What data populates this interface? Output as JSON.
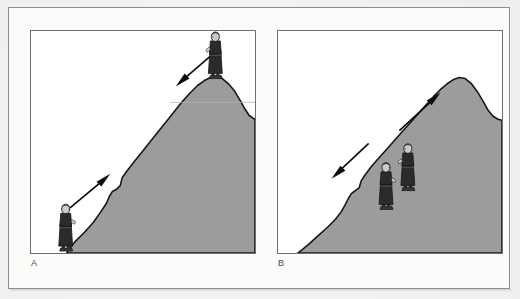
{
  "figure": {
    "panels": [
      {
        "id": "A",
        "label": "A",
        "caption_letter": "A",
        "description": "Single rounded hill with a person standing at the summit and a person standing at the base; one arrow points up the slope and one arrow points down the slope.",
        "terrain_fill": "#9c9c9c",
        "terrain_outline": "#1a1a1a",
        "background": "#ffffff",
        "figures": [
          {
            "name": "climber-at-summit",
            "position": "summit",
            "facing": "right",
            "coat_color": "#2b2b2b",
            "hair_color": "#c9c9c9"
          },
          {
            "name": "climber-at-base",
            "position": "base",
            "facing": "right",
            "coat_color": "#2b2b2b",
            "hair_color": "#c9c9c9"
          }
        ],
        "arrows": [
          {
            "name": "arrow-descend",
            "direction": "down-left",
            "color": "#0d0d0d"
          },
          {
            "name": "arrow-ascend",
            "direction": "up-right",
            "color": "#0d0d0d"
          }
        ]
      },
      {
        "id": "B",
        "label": "B",
        "caption_letter": "B",
        "description": "Steeper hill with a rounded peak at the right; two people stand together partway up the slope, one arrow points up toward the peak and one arrow points down the slope.",
        "terrain_fill": "#9c9c9c",
        "terrain_outline": "#1a1a1a",
        "background": "#ffffff",
        "figures": [
          {
            "name": "climber-upper",
            "position": "mid-slope",
            "facing": "right",
            "coat_color": "#2b2b2b",
            "hair_color": "#c9c9c9"
          },
          {
            "name": "climber-lower",
            "position": "mid-slope",
            "facing": "right",
            "coat_color": "#2b2b2b",
            "hair_color": "#c9c9c9"
          }
        ],
        "arrows": [
          {
            "name": "arrow-ascend",
            "direction": "up-right",
            "color": "#0d0d0d"
          },
          {
            "name": "arrow-descend",
            "direction": "down-left",
            "color": "#0d0d0d"
          }
        ]
      }
    ],
    "colors": {
      "paper": "#f4f3f1",
      "frame_border": "#8d8d8d",
      "panel_border": "#6f6f6f",
      "terrain_gray": "#9c9c9c",
      "ink": "#1a1a1a",
      "label_text": "#4a4a4a"
    }
  }
}
